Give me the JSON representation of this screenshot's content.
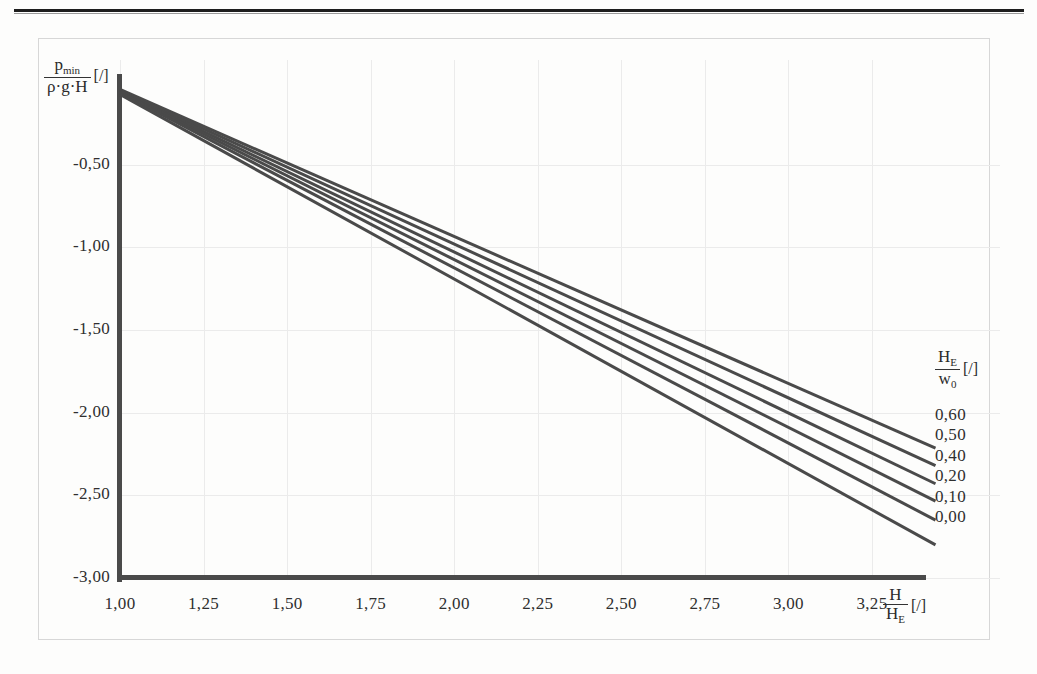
{
  "page": {
    "rule_top": "horizontal-rule"
  },
  "chart_data": {
    "type": "line",
    "title": "",
    "xlabel_num": "H",
    "xlabel_den": "H_E",
    "xlabel_unit": "[/]",
    "ylabel_num": "p_min",
    "ylabel_den": "ρ·g·H",
    "ylabel_unit": "[/]",
    "xticks": [
      "1,00",
      "1,25",
      "1,50",
      "1,75",
      "2,00",
      "2,25",
      "2,50",
      "2,75",
      "3,00",
      "3,25"
    ],
    "xtick_values": [
      1.0,
      1.25,
      1.5,
      1.75,
      2.0,
      2.25,
      2.5,
      2.75,
      3.0,
      3.25
    ],
    "yticks": [
      "-0,50",
      "-1,00",
      "-1,50",
      "-2,00",
      "-2,50",
      "-3,00"
    ],
    "ytick_values": [
      -0.5,
      -1.0,
      -1.5,
      -2.0,
      -2.5,
      -3.0
    ],
    "xlim": [
      1.0,
      3.45
    ],
    "ylim": [
      -3.0,
      0.0
    ],
    "grid": true,
    "legend_position": "right",
    "legend_title_num": "H_E",
    "legend_title_den": "w_0",
    "legend_title_unit": "[/]",
    "x": [
      1.0,
      3.44
    ],
    "series": [
      {
        "name": "0,60",
        "values": [
          -0.045,
          -2.215
        ]
      },
      {
        "name": "0,50",
        "values": [
          -0.05,
          -2.32
        ]
      },
      {
        "name": "0,40",
        "values": [
          -0.055,
          -2.43
        ]
      },
      {
        "name": "0,20",
        "values": [
          -0.06,
          -2.535
        ]
      },
      {
        "name": "0,10",
        "values": [
          -0.065,
          -2.65
        ]
      },
      {
        "name": "0,00",
        "values": [
          -0.075,
          -2.8
        ]
      }
    ]
  },
  "legend": {
    "values": [
      "0,60",
      "0,50",
      "0,40",
      "0,20",
      "0,10",
      "0,00"
    ]
  }
}
